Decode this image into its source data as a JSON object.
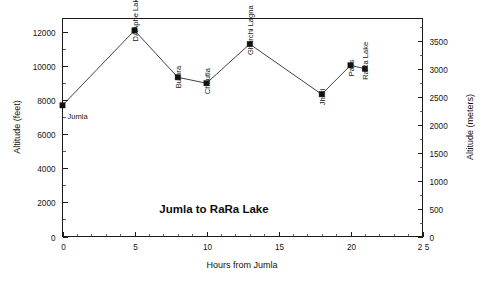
{
  "chart_data": {
    "type": "line",
    "title": "Jumla to RaRa Lake",
    "xlabel": "Hours from Jumla",
    "ylabel": "Altitude (feet)",
    "ylabel_secondary": "Altitude (meters)",
    "xlim": [
      0,
      25
    ],
    "ylim": [
      0,
      12800
    ],
    "ylim_secondary": [
      0,
      3901
    ],
    "grid": false,
    "legend": "none",
    "x_ticks": [
      0,
      5,
      10,
      15,
      20,
      25
    ],
    "x_tick_labels": [
      "0",
      "5",
      "10",
      "15",
      "20",
      "2 5"
    ],
    "x_minor_step": 1,
    "y_ticks": [
      0,
      2000,
      4000,
      6000,
      8000,
      10000,
      12000
    ],
    "y_tick_labels": [
      "0",
      "2000",
      "4000",
      "6000",
      "8000",
      "10000",
      "12000"
    ],
    "y_minor_step": 1000,
    "y_ticks_secondary": [
      0,
      500,
      1000,
      1500,
      2000,
      2500,
      3000,
      3500
    ],
    "y_tick_labels_secondary": [
      "0",
      "500",
      "1000",
      "1500",
      "2000",
      "2500",
      "3000",
      "3500"
    ],
    "y_minor_step_secondary": 250,
    "series": [
      {
        "name": "Route profile",
        "marker": "square",
        "color": "#111111",
        "points": [
          {
            "label": "Jumla",
            "x": 0,
            "y": 7700,
            "label_rotated": false
          },
          {
            "label": "DAAphe Lakh",
            "x": 5,
            "y": 12100,
            "label_rotated": true
          },
          {
            "label": "Bumra",
            "x": 8,
            "y": 9350,
            "label_rotated": true
          },
          {
            "label": "Chautla",
            "x": 10,
            "y": 9000,
            "label_rotated": true
          },
          {
            "label": "Ghurchi Lagna",
            "x": 13,
            "y": 11300,
            "label_rotated": true
          },
          {
            "label": "Jhari",
            "x": 18,
            "y": 8350,
            "label_rotated": true
          },
          {
            "label": "Pass",
            "x": 20,
            "y": 10050,
            "label_rotated": true
          },
          {
            "label": "RaRa Lake",
            "x": 21,
            "y": 9850,
            "label_rotated": true
          }
        ]
      }
    ]
  },
  "colors": {
    "background": "#ffffff",
    "axis": "#1a1a1a",
    "line": "#2b2b2b",
    "marker": "#111111",
    "text": "#141414"
  }
}
